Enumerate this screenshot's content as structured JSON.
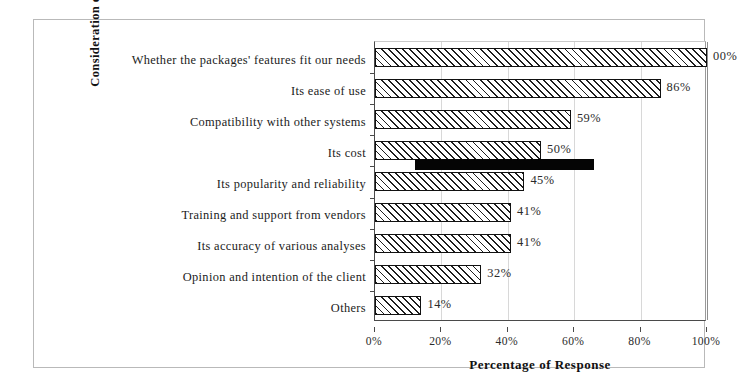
{
  "chart_data": {
    "type": "bar",
    "orientation": "horizontal",
    "title": "",
    "xlabel": "Percentage of Response",
    "ylabel": "Consideration on Selection",
    "xlim": [
      0,
      100
    ],
    "grid": true,
    "legend": "none",
    "categories": [
      "Whether the packages' features fit our needs",
      "Its ease of use",
      "Compatibility with other systems",
      "Its cost",
      "Its popularity and reliability",
      "Training and support from vendors",
      "Its accuracy of various analyses",
      "Opinion and intention of the client",
      "Others"
    ],
    "values": [
      100,
      86,
      59,
      50,
      45,
      41,
      41,
      32,
      14
    ],
    "data_labels": [
      "00%",
      "86%",
      "59%",
      "50%",
      "45%",
      "41%",
      "41%",
      "32%",
      "14%"
    ],
    "xticks": [
      0,
      20,
      40,
      60,
      80,
      100
    ],
    "xtick_labels": [
      "0%",
      "20%",
      "40%",
      "60%",
      "80%",
      "100%"
    ],
    "bar_style": {
      "fill": "diagonal-hatch",
      "edge_color": "#111111",
      "face_color": "#ffffff"
    },
    "annotations": [
      {
        "name": "redaction-artifact",
        "description": "solid black bar overlapping the Its cost row",
        "start": 12,
        "end": 66,
        "color": "#050505"
      }
    ]
  },
  "figure": {
    "frame_color": "#b9b9b9"
  }
}
